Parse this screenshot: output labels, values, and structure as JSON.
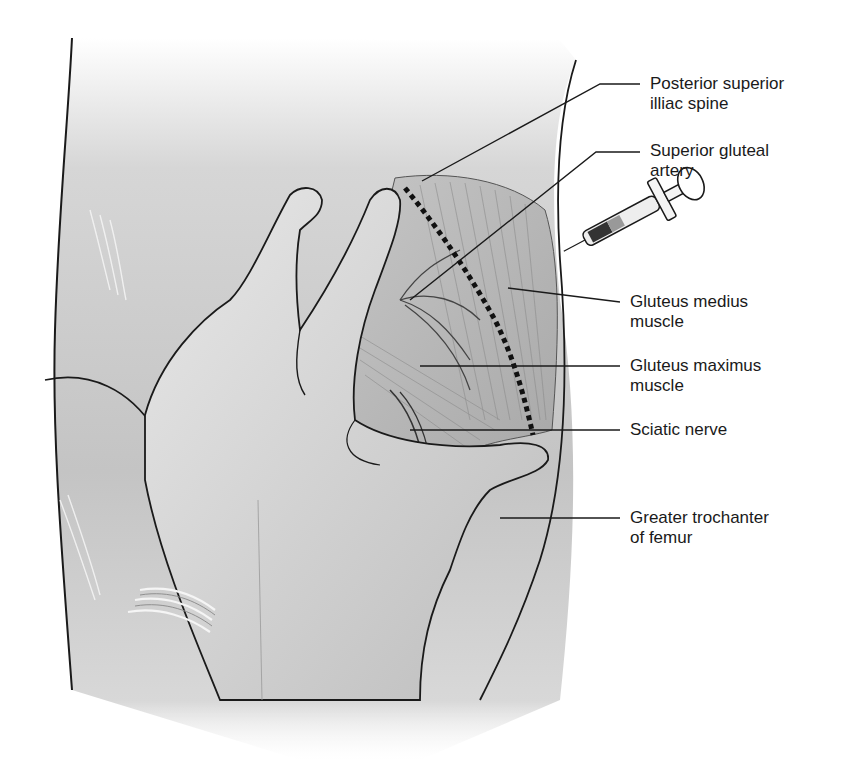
{
  "figure": {
    "colors": {
      "background": "#ffffff",
      "skin_shade": "#c8c8c8",
      "muscle_shade": "#b0b0b0",
      "outline": "#1a1a1a",
      "label_text": "#1a1a1a"
    }
  },
  "labels": [
    {
      "id": "psis",
      "line1": "Posterior superior",
      "line2": "illiac spine"
    },
    {
      "id": "sga",
      "line1": "Superior gluteal",
      "line2": "artery"
    },
    {
      "id": "gmed",
      "line1": "Gluteus medius",
      "line2": "muscle"
    },
    {
      "id": "gmax",
      "line1": "Gluteus maximus",
      "line2": "muscle"
    },
    {
      "id": "sciatic",
      "line1": "Sciatic nerve",
      "line2": ""
    },
    {
      "id": "trochanter",
      "line1": "Greater trochanter",
      "line2": "of femur"
    }
  ]
}
